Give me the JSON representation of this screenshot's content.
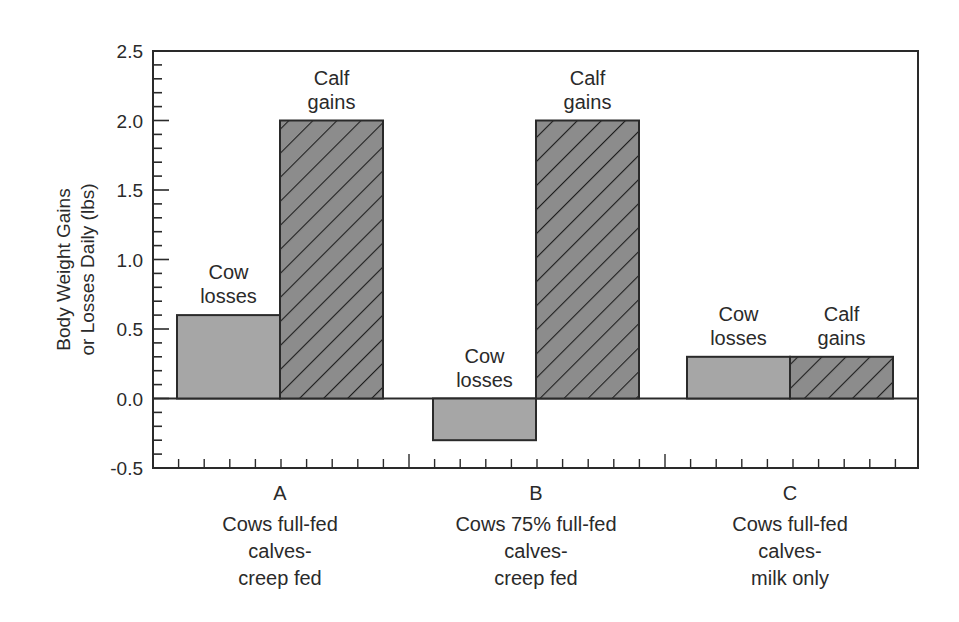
{
  "chart_data": {
    "type": "bar",
    "title": "",
    "xlabel": "",
    "ylabel": "Body Weight Gains or Losses Daily (lbs)",
    "ylabel_lines": [
      "Body Weight Gains",
      "or Losses Daily (lbs)"
    ],
    "ylim": [
      -0.5,
      2.5
    ],
    "yticks": [
      "-0.5",
      "0.0",
      "0.5",
      "1.0",
      "1.5",
      "2.0",
      "2.5"
    ],
    "ytick_values": [
      -0.5,
      0.0,
      0.5,
      1.0,
      1.5,
      2.0,
      2.5
    ],
    "grid": false,
    "legend": null,
    "categories": [
      "A",
      "B",
      "C"
    ],
    "category_descriptions": [
      [
        "Cows full-fed",
        "calves-",
        "creep fed"
      ],
      [
        "Cows 75% full-fed",
        "calves-",
        "creep fed"
      ],
      [
        "Cows full-fed",
        "calves-",
        "milk only"
      ]
    ],
    "series": [
      {
        "name": "Cow losses",
        "label_lines": [
          "Cow",
          "losses"
        ],
        "values": [
          0.6,
          -0.3,
          0.3
        ],
        "fill": "#a6a6a6",
        "pattern": "solid"
      },
      {
        "name": "Calf gains",
        "label_lines": [
          "Calf",
          "gains"
        ],
        "values": [
          2.0,
          2.0,
          0.3
        ],
        "fill": "#8c8c8c",
        "pattern": "diagonal-hatch"
      }
    ],
    "colors": {
      "axis": "#2a2a2a",
      "cow_fill": "#a6a6a6",
      "calf_fill": "#8c8c8c",
      "hatch": "#1e1e1e"
    }
  }
}
